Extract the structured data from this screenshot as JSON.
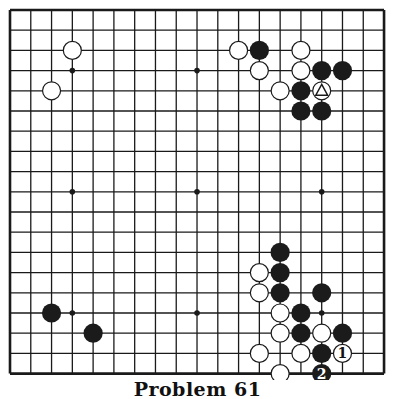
{
  "caption": "Problem 61",
  "board": {
    "size": 19,
    "origin_x": 10,
    "origin_y": 10,
    "spacing_x": 20.78,
    "spacing_y": 20.2,
    "line_color": "#1a1a1a",
    "stone_black": "#1b1b1b",
    "stone_white": "#ffffff",
    "star_points": [
      [
        3,
        3
      ],
      [
        9,
        3
      ],
      [
        15,
        3
      ],
      [
        3,
        9
      ],
      [
        9,
        9
      ],
      [
        15,
        9
      ],
      [
        3,
        15
      ],
      [
        9,
        15
      ],
      [
        15,
        15
      ]
    ]
  },
  "stones": [
    {
      "color": "white",
      "col": 3,
      "row": 2
    },
    {
      "color": "white",
      "col": 2,
      "row": 4
    },
    {
      "color": "white",
      "col": 11,
      "row": 2
    },
    {
      "color": "black",
      "col": 12,
      "row": 2
    },
    {
      "color": "white",
      "col": 14,
      "row": 2
    },
    {
      "color": "white",
      "col": 12,
      "row": 3
    },
    {
      "color": "white",
      "col": 14,
      "row": 3
    },
    {
      "color": "black",
      "col": 15,
      "row": 3
    },
    {
      "color": "black",
      "col": 16,
      "row": 3
    },
    {
      "color": "white",
      "col": 13,
      "row": 4
    },
    {
      "color": "black",
      "col": 14,
      "row": 4
    },
    {
      "color": "white",
      "col": 15,
      "row": 4,
      "mark": "triangle"
    },
    {
      "color": "black",
      "col": 14,
      "row": 5
    },
    {
      "color": "black",
      "col": 15,
      "row": 5
    },
    {
      "color": "black",
      "col": 13,
      "row": 12
    },
    {
      "color": "white",
      "col": 12,
      "row": 13
    },
    {
      "color": "black",
      "col": 13,
      "row": 13
    },
    {
      "color": "white",
      "col": 12,
      "row": 14
    },
    {
      "color": "black",
      "col": 13,
      "row": 14
    },
    {
      "color": "black",
      "col": 15,
      "row": 14
    },
    {
      "color": "white",
      "col": 13,
      "row": 15
    },
    {
      "color": "black",
      "col": 14,
      "row": 15
    },
    {
      "color": "white",
      "col": 13,
      "row": 16
    },
    {
      "color": "black",
      "col": 14,
      "row": 16
    },
    {
      "color": "white",
      "col": 15,
      "row": 16
    },
    {
      "color": "black",
      "col": 16,
      "row": 16
    },
    {
      "color": "white",
      "col": 12,
      "row": 17
    },
    {
      "color": "white",
      "col": 14,
      "row": 17
    },
    {
      "color": "black",
      "col": 15,
      "row": 17
    },
    {
      "color": "white",
      "col": 16,
      "row": 17,
      "label": "1"
    },
    {
      "color": "white",
      "col": 13,
      "row": 18
    },
    {
      "color": "black",
      "col": 15,
      "row": 18,
      "label": "2"
    },
    {
      "color": "black",
      "col": 2,
      "row": 15
    },
    {
      "color": "black",
      "col": 4,
      "row": 16
    }
  ]
}
